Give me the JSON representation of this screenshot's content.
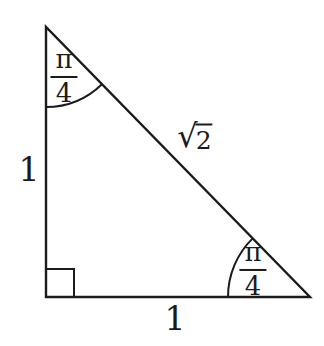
{
  "diagram": {
    "background_color": "#ffffff",
    "line_color": "#1b1b1b",
    "side_labels": {
      "left": "1",
      "bottom": "1",
      "hypotenuse": {
        "radical": "√",
        "radicand": "2"
      }
    },
    "angle_labels": {
      "top": {
        "numerator": "π",
        "denominator": "4"
      },
      "bottom_right": {
        "numerator": "π",
        "denominator": "4"
      }
    },
    "markers": {
      "bottom_left": "right-angle-square"
    }
  }
}
